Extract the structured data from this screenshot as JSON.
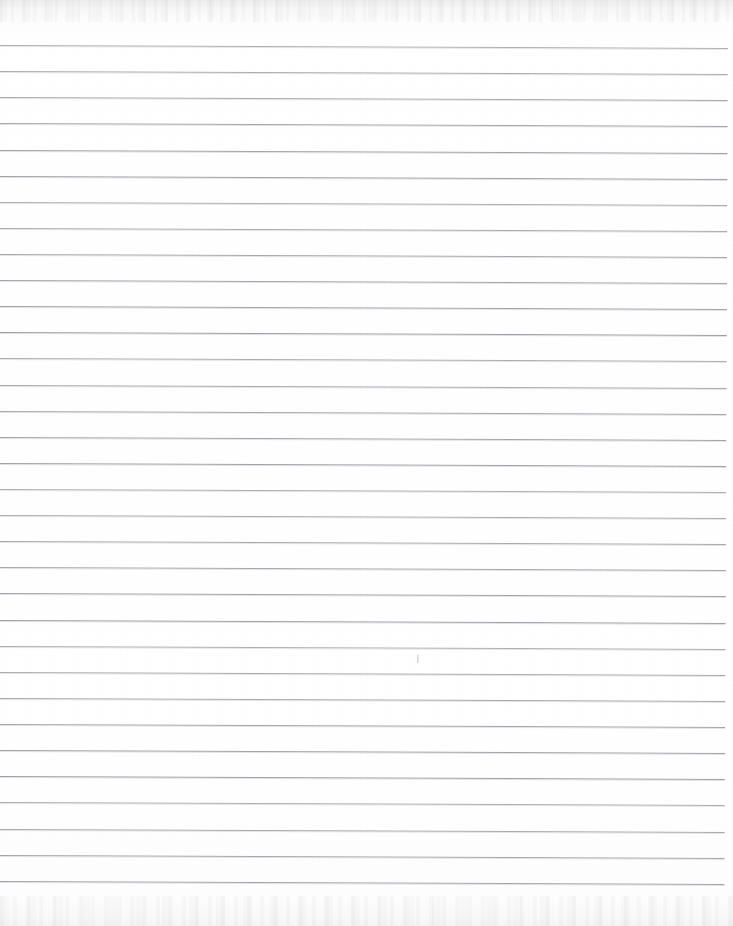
{
  "document": {
    "kind": "scanned-lined-paper",
    "description": "Blank scanned sheet of ruled notebook paper",
    "page_width_px": 733,
    "page_height_px": 926,
    "background_color": "#ffffff",
    "paper_tone_color": "#fdfdfd",
    "visible_text": ""
  },
  "ruling": {
    "line_color": "#9d9da3",
    "line_halo_color": "#c9c9cf",
    "line_thickness_px": 1,
    "line_count": 33,
    "first_line_y_px": 45,
    "line_spacing_px": 26.1,
    "line_start_x_px": 0,
    "line_end_x_px": 728,
    "skew_degrees": 0.23,
    "line_y_positions": [
      45,
      71,
      97,
      123,
      150,
      176,
      202,
      228,
      254,
      280,
      306,
      332,
      358,
      385,
      411,
      437,
      463,
      489,
      515,
      541,
      567,
      593,
      620,
      646,
      672,
      698,
      724,
      750,
      776,
      802,
      829,
      855,
      881
    ]
  },
  "artifacts": {
    "top_noise_band": {
      "label": "scan-noise-band-top",
      "y_px": 0,
      "height_px": 22,
      "color": "#a5a5aa"
    },
    "bottom_noise_band": {
      "label": "scan-noise-band-bottom",
      "y_px": 896,
      "height_px": 30,
      "color": "#aaaab0"
    },
    "stray_marks": [
      {
        "label": "pencil-tick",
        "x_px": 420,
        "y_px": 653,
        "width_px": 1,
        "height_px": 8,
        "color": "#b4b4ba"
      }
    ]
  }
}
